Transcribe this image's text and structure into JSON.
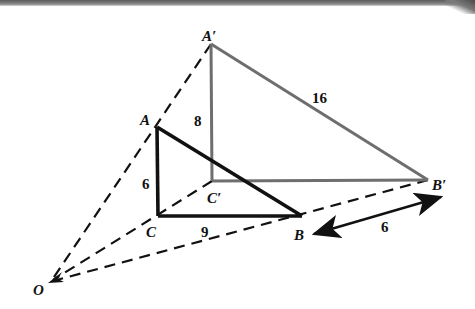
{
  "figure": {
    "colors": {
      "original_triangle": "#111111",
      "image_triangle": "#6e6e6e",
      "dashed_rays": "#111111",
      "top_bar": "#6a6a6a"
    },
    "points": {
      "O": {
        "label": "O",
        "x": 50,
        "y": 282
      },
      "A": {
        "label": "A",
        "x": 157,
        "y": 127
      },
      "B": {
        "label": "B",
        "x": 302,
        "y": 216
      },
      "C": {
        "label": "C",
        "x": 158,
        "y": 216
      },
      "A_prime": {
        "label": "A′",
        "x": 211,
        "y": 44
      },
      "B_prime": {
        "label": "B′",
        "x": 428,
        "y": 180
      },
      "C_prime": {
        "label": "C′",
        "x": 212,
        "y": 181
      }
    },
    "measurements": {
      "AC": "6",
      "CB": "9",
      "A_prime_C_prime": "8",
      "A_prime_B_prime": "16",
      "B_to_B_prime": "6"
    }
  }
}
